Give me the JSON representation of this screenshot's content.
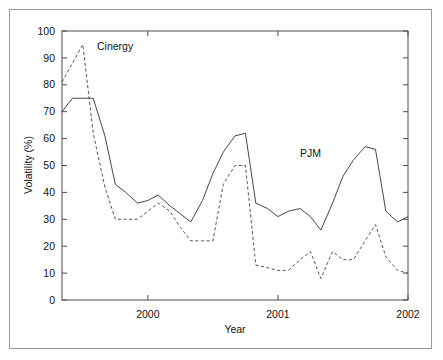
{
  "chart_data": {
    "type": "line",
    "title": "",
    "xlabel": "Year",
    "ylabel": "Volatility (%)",
    "xlim": [
      1999.34,
      2002.0
    ],
    "ylim": [
      0,
      100
    ],
    "xticks": [
      2000,
      2001,
      2002
    ],
    "xtick_labels": [
      "2000",
      "2001",
      "2002"
    ],
    "yticks": [
      0,
      10,
      20,
      30,
      40,
      50,
      60,
      70,
      80,
      90,
      100
    ],
    "ytick_labels": [
      "0",
      "10",
      "20",
      "30",
      "40",
      "50",
      "60",
      "70",
      "80",
      "90",
      "100"
    ],
    "grid": false,
    "legend_position": "inline-annotation",
    "series": [
      {
        "name": "PJM",
        "style": "solid",
        "color": "#333333",
        "label_x": 2001.07,
        "label_y": 52.0,
        "x": [
          1999.34,
          1999.42,
          1999.5,
          1999.58,
          1999.67,
          1999.75,
          1999.83,
          1999.92,
          2000.0,
          2000.08,
          2000.17,
          2000.25,
          2000.33,
          2000.42,
          2000.5,
          2000.58,
          2000.67,
          2000.75,
          2000.83,
          2000.92,
          2001.0,
          2001.08,
          2001.17,
          2001.25,
          2001.33,
          2001.42,
          2001.5,
          2001.58,
          2001.67,
          2001.75,
          2001.83,
          2001.92,
          2002.0
        ],
        "values": [
          70,
          75,
          75,
          75,
          61,
          43,
          40,
          36,
          37,
          39,
          35,
          32,
          29,
          37,
          47,
          55,
          61,
          62,
          36,
          34,
          31,
          33,
          34,
          31,
          26,
          36,
          46,
          52,
          57,
          56,
          33,
          29,
          31
        ]
      },
      {
        "name": "Cinergy",
        "style": "dashed",
        "color": "#444444",
        "label_x": 1999.64,
        "label_y": 91.0,
        "x": [
          1999.34,
          1999.42,
          1999.5,
          1999.58,
          1999.67,
          1999.75,
          1999.83,
          1999.92,
          2000.0,
          2000.08,
          2000.17,
          2000.25,
          2000.33,
          2000.42,
          2000.5,
          2000.58,
          2000.67,
          2000.75,
          2000.83,
          2000.92,
          2001.0,
          2001.08,
          2001.17,
          2001.25,
          2001.33,
          2001.42,
          2001.5,
          2001.58,
          2001.67,
          2001.75,
          2001.83,
          2001.92,
          2002.0
        ],
        "values": [
          81,
          88,
          95,
          62,
          42,
          30,
          30,
          30,
          33,
          36,
          33,
          27,
          22,
          22,
          22,
          43,
          50,
          50,
          13,
          12,
          11,
          11,
          15,
          18,
          8,
          18,
          15,
          15,
          22,
          28,
          16,
          11,
          10
        ]
      }
    ]
  },
  "axes": {
    "ylabel": "Volatility (%)",
    "xlabel": "Year"
  },
  "labels": {
    "cinergy": "Cinergy",
    "pjm": "PJM"
  }
}
